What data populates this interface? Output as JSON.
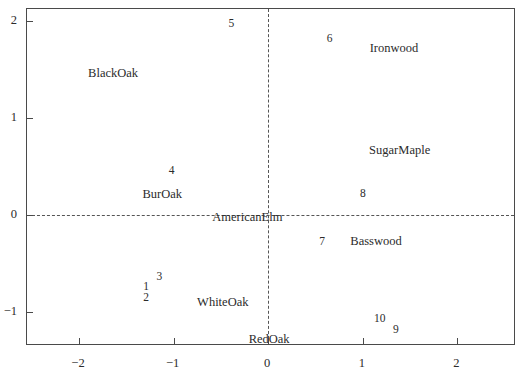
{
  "chart_data": {
    "type": "scatter",
    "title": "",
    "subtitle": "",
    "xlabel": "",
    "ylabel": "",
    "xlim": [
      -2.55,
      2.62
    ],
    "ylim": [
      -1.35,
      2.12
    ],
    "xticks": [
      -2,
      -1,
      0,
      1,
      2
    ],
    "xtick_labels": [
      "−2",
      "−1",
      "0",
      "1",
      "2"
    ],
    "yticks": [
      -1,
      0,
      1,
      2
    ],
    "ytick_labels": [
      "−1",
      "0",
      "1",
      "2"
    ],
    "grid": false,
    "legend": "none",
    "reference_lines": {
      "horizontal": 0,
      "vertical": 0,
      "style": "dashed"
    },
    "series": [
      {
        "name": "observations",
        "marker": "text-number",
        "points": [
          {
            "label": "1",
            "x": -1.29,
            "y": -0.73
          },
          {
            "label": "2",
            "x": -1.29,
            "y": -0.85
          },
          {
            "label": "3",
            "x": -1.15,
            "y": -0.63
          },
          {
            "label": "4",
            "x": -1.02,
            "y": 0.46
          },
          {
            "label": "5",
            "x": -0.39,
            "y": 1.98
          },
          {
            "label": "6",
            "x": 0.65,
            "y": 1.82
          },
          {
            "label": "7",
            "x": 0.57,
            "y": -0.27
          },
          {
            "label": "8",
            "x": 1.0,
            "y": 0.23
          },
          {
            "label": "9",
            "x": 1.35,
            "y": -1.18
          },
          {
            "label": "10",
            "x": 1.18,
            "y": -1.06
          }
        ]
      },
      {
        "name": "variables",
        "marker": "text-name",
        "points": [
          {
            "label": "BlackOak",
            "x": -1.64,
            "y": 1.46
          },
          {
            "label": "BurOak",
            "x": -1.12,
            "y": 0.21
          },
          {
            "label": "AmericanElm",
            "x": -0.22,
            "y": -0.02
          },
          {
            "label": "WhiteOak",
            "x": -0.48,
            "y": -0.9
          },
          {
            "label": "RedOak",
            "x": 0.01,
            "y": -1.28
          },
          {
            "label": "Basswood",
            "x": 1.14,
            "y": -0.27
          },
          {
            "label": "SugarMaple",
            "x": 1.39,
            "y": 0.67
          },
          {
            "label": "Ironwood",
            "x": 1.33,
            "y": 1.72
          }
        ]
      }
    ]
  }
}
